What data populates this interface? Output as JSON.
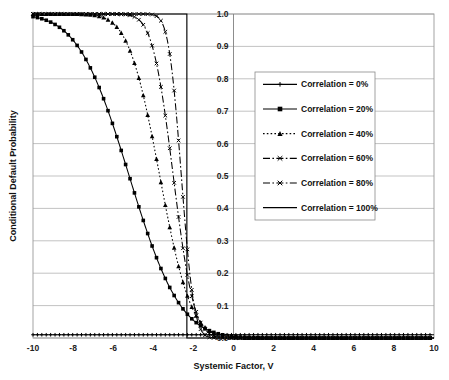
{
  "chart_data": {
    "type": "line",
    "title": "",
    "xlabel": "Systemic Factor, V",
    "ylabel": "Conditional Default Probability",
    "xlim": [
      -10,
      10
    ],
    "ylim": [
      0,
      1
    ],
    "xticks": [
      "-10",
      "-8",
      "-6",
      "-4",
      "-2",
      "0",
      "2",
      "4",
      "6",
      "8",
      "10"
    ],
    "xtick_values": [
      -10,
      -8,
      -6,
      -4,
      -2,
      0,
      2,
      4,
      6,
      8,
      10
    ],
    "yticks": [
      "0.0",
      "0.1",
      "0.2",
      "0.3",
      "0.4",
      "0.5",
      "0.6",
      "0.7",
      "0.8",
      "0.9",
      "1.0"
    ],
    "ytick_values": [
      0.0,
      0.1,
      0.2,
      0.3,
      0.4,
      0.5,
      0.6,
      0.7,
      0.8,
      0.9,
      1.0
    ],
    "grid": "horizontal",
    "legend_position": "center-right-inside",
    "unconditional_pd": 0.01,
    "x": [
      -10,
      -9.5,
      -9,
      -8.5,
      -8,
      -7.5,
      -7,
      -6.5,
      -6,
      -5.5,
      -5,
      -4.5,
      -4,
      -3.5,
      -3,
      -2.5,
      -2.33,
      -2,
      -1.5,
      -1,
      -0.5,
      0,
      0.5,
      1,
      1.5,
      2,
      3,
      4,
      5,
      6,
      7,
      8,
      9,
      10
    ],
    "series": [
      {
        "name": "Correlation = 0%",
        "correlation": 0,
        "marker": "plus",
        "dash": "solid",
        "values": [
          0.01,
          0.01,
          0.01,
          0.01,
          0.01,
          0.01,
          0.01,
          0.01,
          0.01,
          0.01,
          0.01,
          0.01,
          0.01,
          0.01,
          0.01,
          0.01,
          0.01,
          0.01,
          0.01,
          0.01,
          0.01,
          0.01,
          0.01,
          0.01,
          0.01,
          0.01,
          0.01,
          0.01,
          0.01,
          0.01,
          0.01,
          0.01,
          0.01,
          0.01
        ]
      },
      {
        "name": "Correlation = 20%",
        "correlation": 0.2,
        "marker": "square",
        "dash": "solid",
        "values": [
          0.372,
          0.334,
          0.298,
          0.264,
          0.232,
          0.202,
          0.174,
          0.148,
          0.125,
          0.104,
          0.0855,
          0.0693,
          0.0553,
          0.0434,
          0.0334,
          0.0252,
          0.0228,
          0.0186,
          0.0134,
          0.0094,
          0.0064,
          0.0043,
          0.0028,
          0.0018,
          0.0011,
          0.0007,
          0.00024,
          8e-05,
          2e-05,
          5e-06,
          1e-06,
          2e-07,
          4e-08,
          1e-08
        ]
      },
      {
        "name": "Correlation = 40%",
        "correlation": 0.4,
        "marker": "triangle",
        "dash": "dotted",
        "values": [
          0.968,
          0.952,
          0.931,
          0.905,
          0.873,
          0.834,
          0.788,
          0.735,
          0.675,
          0.609,
          0.539,
          0.466,
          0.392,
          0.32,
          0.252,
          0.19,
          0.172,
          0.137,
          0.0927,
          0.0586,
          0.0344,
          0.0186,
          0.0092,
          0.00415,
          0.0017,
          0.00063,
          6e-05,
          4e-06,
          2e-07,
          1e-08,
          0,
          0,
          0,
          0
        ]
      },
      {
        "name": "Correlation = 60%",
        "correlation": 0.6,
        "marker": "x",
        "dash": "dashdot",
        "values": [
          1.0,
          1.0,
          1.0,
          1.0,
          0.9999,
          0.9996,
          0.9988,
          0.9966,
          0.991,
          0.979,
          0.957,
          0.919,
          0.861,
          0.781,
          0.679,
          0.56,
          0.518,
          0.434,
          0.31,
          0.198,
          0.11,
          0.0522,
          0.0204,
          0.0063,
          0.0015,
          0.00026,
          2e-06,
          0,
          0,
          0,
          0,
          0,
          0,
          0
        ]
      },
      {
        "name": "Correlation = 80%",
        "correlation": 0.8,
        "marker": "x",
        "dash": "dashdot",
        "values": [
          1.0,
          1.0,
          1.0,
          1.0,
          1.0,
          1.0,
          1.0,
          1.0,
          1.0,
          1.0,
          0.99997,
          0.9998,
          0.9989,
          0.9944,
          0.978,
          0.925,
          0.893,
          0.806,
          0.606,
          0.359,
          0.152,
          0.0408,
          0.0063,
          0.00051,
          2e-05,
          3e-07,
          0,
          0,
          0,
          0,
          0,
          0,
          0,
          0
        ]
      },
      {
        "name": "Correlation = 100%",
        "correlation": 1.0,
        "marker": "none",
        "dash": "solid",
        "step_at": -2.326,
        "values": [
          1,
          1,
          1,
          1,
          1,
          1,
          1,
          1,
          1,
          1,
          1,
          1,
          1,
          1,
          1,
          1,
          1,
          0,
          0,
          0,
          0,
          0,
          0,
          0,
          0,
          0,
          0,
          0,
          0,
          0,
          0,
          0,
          0,
          0
        ]
      }
    ]
  },
  "legend": {
    "entries": [
      {
        "label": "Correlation = 0%"
      },
      {
        "label": "Correlation = 20%"
      },
      {
        "label": "Correlation = 40%"
      },
      {
        "label": "Correlation = 60%"
      },
      {
        "label": "Correlation = 80%"
      },
      {
        "label": "Correlation = 100%"
      }
    ]
  },
  "colors": {
    "series": "#000000",
    "grid": "#a9a9a9",
    "axis": "#808080",
    "background": "#ffffff",
    "text": "#111111"
  }
}
